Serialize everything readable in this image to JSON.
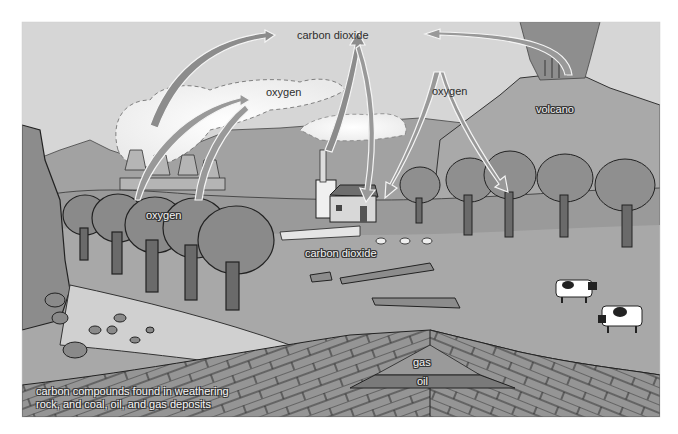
{
  "diagram": {
    "style": "grayscale",
    "colors": {
      "sky": "#d9d9d9",
      "ground": "#a6a6a6",
      "mountains": "#9c9c9c",
      "arrow_fill": "#8c8c8c",
      "rock_layers": "#959595",
      "oil_layer": "#7a7a7a",
      "text_dark": "#333333"
    },
    "labels": {
      "top_carbon_dioxide": "carbon dioxide",
      "oxygen_cloud": "oxygen",
      "oxygen_right": "oxygen",
      "volcano": "volcano",
      "oxygen_trees": "oxygen",
      "ground_carbon_dioxide": "carbon dioxide",
      "gas": "gas",
      "oil": "oil",
      "caption_line1": "carbon compounds found in weathering",
      "caption_line2": "rock, and coal, oil, and gas deposits"
    },
    "elements": [
      "power-plant cooling towers with steam",
      "house with chimney smoke",
      "volcano with plume",
      "trees",
      "cows",
      "fallen logs",
      "tree stumps",
      "sheep",
      "rock strata with gas and oil deposit",
      "cliff with boulders"
    ],
    "arrows": [
      {
        "from": "power plant",
        "to": "carbon dioxide",
        "direction": "up"
      },
      {
        "from": "oxygen (trees)",
        "to": "oxygen (cloud)",
        "direction": "up"
      },
      {
        "from": "house",
        "to": "carbon dioxide",
        "direction": "up"
      },
      {
        "from": "carbon dioxide",
        "to": "house area trees",
        "direction": "down"
      },
      {
        "from": "volcano",
        "to": "carbon dioxide",
        "direction": "left"
      },
      {
        "from": "oxygen",
        "to": "trees",
        "direction": "down (split)"
      }
    ]
  }
}
